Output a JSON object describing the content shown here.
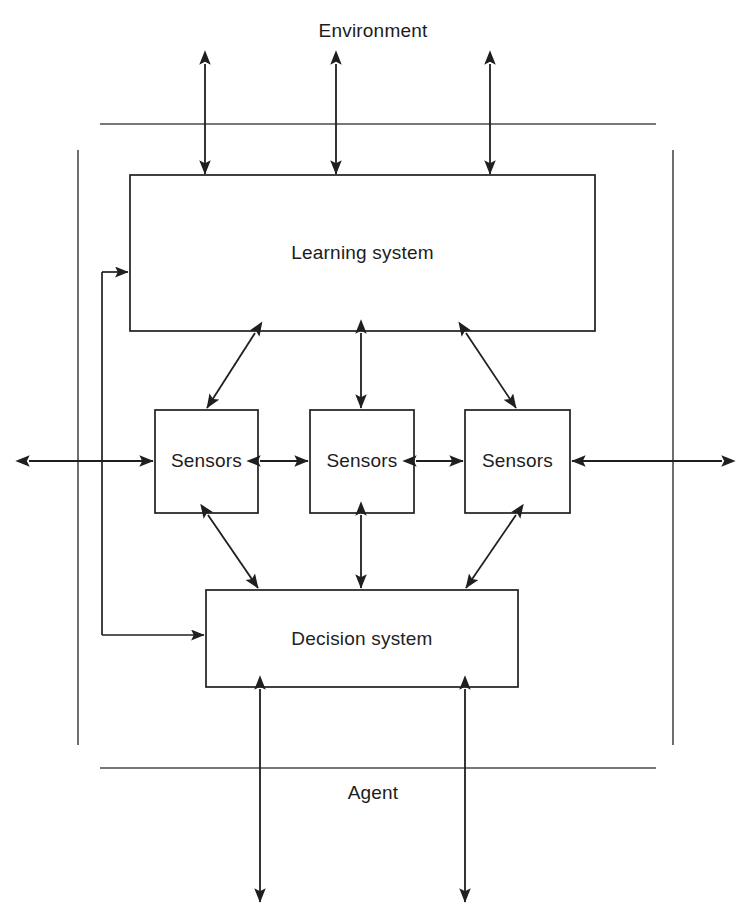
{
  "diagram": {
    "title": "Environment",
    "regions": [
      {
        "id": "environment",
        "label": "Environment"
      },
      {
        "id": "agent",
        "label": "Agent"
      }
    ],
    "boxes": [
      {
        "id": "learning-system",
        "label": "Learning system",
        "x": 130,
        "y": 175,
        "w": 465,
        "h": 156
      },
      {
        "id": "sensors-left",
        "label": "Sensors",
        "x": 155,
        "y": 410,
        "w": 103,
        "h": 103
      },
      {
        "id": "sensors-center",
        "label": "Sensors",
        "x": 310,
        "y": 410,
        "w": 104,
        "h": 103
      },
      {
        "id": "sensors-right",
        "label": "Sensors",
        "x": 465,
        "y": 410,
        "w": 105,
        "h": 103
      },
      {
        "id": "decision-system",
        "label": "Decision system",
        "x": 206,
        "y": 590,
        "w": 312,
        "h": 97
      }
    ],
    "boundaries": {
      "environment_line_y": 124,
      "agent_line_y": 768,
      "agent_left_edge_x": 78,
      "agent_right_edge_x": 673
    },
    "colors": {
      "stroke": "#1f1f1f",
      "background": "#ffffff",
      "text": "#1c1c1c"
    },
    "connections": [
      {
        "from": "environment",
        "to": "learning-system",
        "kind": "bidirectional",
        "orientation": "vertical"
      },
      {
        "from": "environment",
        "to": "learning-system",
        "kind": "bidirectional",
        "orientation": "vertical"
      },
      {
        "from": "environment",
        "to": "learning-system",
        "kind": "bidirectional",
        "orientation": "vertical"
      },
      {
        "from": "learning-system",
        "to": "sensors-left",
        "kind": "bidirectional",
        "orientation": "diagonal"
      },
      {
        "from": "learning-system",
        "to": "sensors-center",
        "kind": "bidirectional",
        "orientation": "vertical"
      },
      {
        "from": "learning-system",
        "to": "sensors-right",
        "kind": "bidirectional",
        "orientation": "diagonal"
      },
      {
        "from": "sensors-left",
        "to": "sensors-center",
        "kind": "bidirectional",
        "orientation": "horizontal"
      },
      {
        "from": "sensors-center",
        "to": "sensors-right",
        "kind": "bidirectional",
        "orientation": "horizontal"
      },
      {
        "from": "sensors-left",
        "to": "decision-system",
        "kind": "bidirectional",
        "orientation": "diagonal"
      },
      {
        "from": "sensors-center",
        "to": "decision-system",
        "kind": "bidirectional",
        "orientation": "vertical"
      },
      {
        "from": "sensors-right",
        "to": "decision-system",
        "kind": "bidirectional",
        "orientation": "diagonal"
      },
      {
        "from": "environment",
        "to": "sensors-left",
        "kind": "bidirectional",
        "orientation": "horizontal"
      },
      {
        "from": "environment",
        "to": "sensors-right",
        "kind": "bidirectional",
        "orientation": "horizontal"
      },
      {
        "from": "decision-system",
        "to": "environment",
        "kind": "bidirectional",
        "orientation": "vertical"
      },
      {
        "from": "decision-system",
        "to": "environment",
        "kind": "bidirectional",
        "orientation": "vertical"
      },
      {
        "from": "decision-system",
        "to": "learning-system",
        "kind": "feedback-loop",
        "orientation": "left-rail"
      }
    ]
  }
}
